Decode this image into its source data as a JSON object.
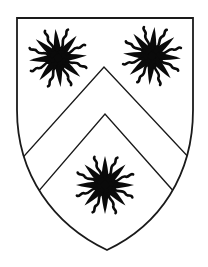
{
  "image": {
    "subject": "Heraldic shield (coat of arms)",
    "width": 208,
    "height": 267,
    "background": "#ffffff"
  },
  "shield": {
    "field_color": "#ffffff",
    "outline_color": "#1a1a1a",
    "ordinary": "chevron",
    "chevron_color": "#ffffff",
    "charges": [
      {
        "name": "sun-in-splendour",
        "position": "dexter-chief",
        "cx": 58,
        "cy": 58,
        "color": "#0a0a0a"
      },
      {
        "name": "sun-in-splendour",
        "position": "sinister-chief",
        "cx": 152,
        "cy": 56,
        "color": "#0a0a0a"
      },
      {
        "name": "sun-in-splendour",
        "position": "base",
        "cx": 105,
        "cy": 185,
        "color": "#0a0a0a"
      }
    ]
  }
}
